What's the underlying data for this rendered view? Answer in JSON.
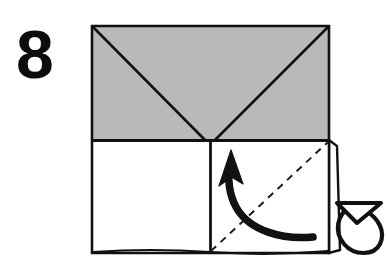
{
  "diagram": {
    "kind": "origami-fold-instruction",
    "step_number": "8",
    "background_color": "#ffffff",
    "ink_color": "#111111",
    "paper_front_color": "#ffffff",
    "paper_back_color": "#b9b9b9",
    "fold_line_style": "dashed",
    "figure": {
      "name": "folded-square-with-two-diagonal-flaps",
      "square": {
        "left": 92,
        "top": 26,
        "right": 329,
        "bottom": 253,
        "width": 237,
        "height": 227,
        "stroke_width": 2.6
      },
      "gray_band": {
        "label": "upper-shaded-region",
        "top": 26,
        "bottom": 140,
        "fill": "#b9b9b9"
      },
      "apex": {
        "x": 210,
        "y": 140
      },
      "center_divider_x": 210
    },
    "elements": {
      "left_diagonal_label": "crease-from-top-left-corner-to-center",
      "right_diagonal_label": "crease-from-top-right-corner-to-center",
      "center_vertical_label": "center-vertical-crease",
      "horizontal_edge_label": "horizontal-folded-edge",
      "dashed_fold_label": "valley-fold-line",
      "curved_arrow_label": "fold-direction-arrow",
      "flap_label": "right-side-flap-edge",
      "turnover_arrow_label": "turn-over-loop-arrow"
    },
    "fold_line": {
      "from_x": 211,
      "from_y": 251,
      "to_x": 328,
      "to_y": 142,
      "dash_pattern": "7 6",
      "stroke_width": 2.0,
      "color": "#1a1a1a"
    },
    "curved_arrow": {
      "tail_x": 313,
      "tail_y": 237,
      "head_x": 229,
      "head_y": 152,
      "direction": "up-left",
      "stroke_width": 7.5,
      "color": "#111111"
    },
    "turnover_arrow": {
      "left": 335,
      "top": 197,
      "right": 382,
      "bottom": 256,
      "color": "#111111",
      "meaning": "turn-over"
    }
  }
}
